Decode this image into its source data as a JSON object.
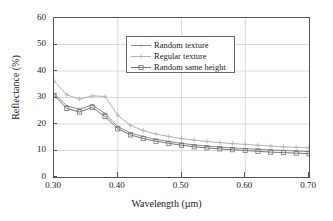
{
  "chart_data": {
    "type": "line",
    "title": "",
    "xlabel": "Wavelength (µm)",
    "ylabel": "Reflectance (%)",
    "xlim": [
      0.3,
      0.7
    ],
    "ylim": [
      0,
      60
    ],
    "xticks": [
      "0.30",
      "0.40",
      "0.50",
      "0.60",
      "0.70"
    ],
    "xtick_values": [
      0.3,
      0.4,
      0.5,
      0.6,
      0.7
    ],
    "yticks": [
      "0",
      "10",
      "20",
      "30",
      "40",
      "50",
      "60"
    ],
    "ytick_values": [
      0,
      10,
      20,
      30,
      40,
      50,
      60
    ],
    "grid": true,
    "legend_position": "upper center",
    "x": [
      0.3,
      0.32,
      0.34,
      0.36,
      0.38,
      0.4,
      0.42,
      0.44,
      0.46,
      0.48,
      0.5,
      0.52,
      0.54,
      0.56,
      0.58,
      0.6,
      0.62,
      0.64,
      0.66,
      0.68,
      0.7
    ],
    "series": [
      {
        "name": "Random texture",
        "marker": "dash-dot",
        "color": "#8c8c8c",
        "values": [
          31.5,
          26.8,
          25.6,
          27.2,
          24.0,
          19.0,
          16.6,
          15.3,
          14.2,
          13.4,
          12.7,
          12.1,
          11.7,
          11.3,
          11.0,
          10.7,
          10.5,
          10.2,
          10.0,
          9.8,
          9.6
        ]
      },
      {
        "name": "Regular texture",
        "marker": "plus",
        "color": "#b3b3b3",
        "values": [
          36.2,
          31.0,
          29.4,
          30.6,
          30.4,
          23.3,
          19.5,
          17.5,
          16.2,
          15.3,
          14.5,
          13.9,
          13.4,
          13.0,
          12.6,
          12.3,
          12.0,
          11.7,
          11.4,
          11.2,
          11.0
        ]
      },
      {
        "name": "Random same height",
        "marker": "square",
        "color": "#777777",
        "values": [
          30.8,
          25.9,
          24.5,
          26.3,
          22.8,
          18.2,
          15.9,
          14.5,
          13.5,
          12.7,
          12.0,
          11.4,
          11.0,
          10.6,
          10.3,
          10.0,
          9.7,
          9.4,
          9.2,
          9.0,
          8.8
        ]
      }
    ]
  }
}
